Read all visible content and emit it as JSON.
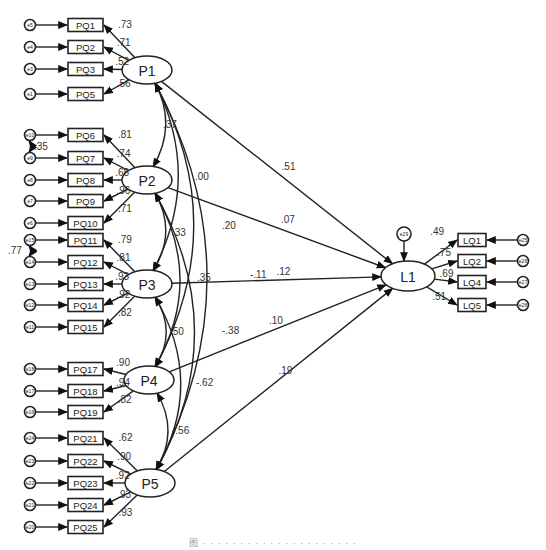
{
  "figure": {
    "caption": "图 · · · · · · · · · · · · · · · · · · · · ·"
  },
  "latents": [
    {
      "id": "P1",
      "label": "P1",
      "x": 147,
      "y": 70
    },
    {
      "id": "P2",
      "label": "P2",
      "x": 147,
      "y": 180
    },
    {
      "id": "P3",
      "label": "P3",
      "x": 147,
      "y": 284
    },
    {
      "id": "P4",
      "label": "P4",
      "x": 149,
      "y": 380
    },
    {
      "id": "P5",
      "label": "P5",
      "x": 150,
      "y": 483
    },
    {
      "id": "L1",
      "label": "L1",
      "x": 408,
      "y": 276
    }
  ],
  "indicators": [
    {
      "label": "PQ1",
      "error": "e5",
      "factor": "P1",
      "loading": ".73",
      "y": 25
    },
    {
      "label": "PQ2",
      "error": "e4",
      "factor": "P1",
      "loading": ".71",
      "y": 47
    },
    {
      "label": "PQ3",
      "error": "e3",
      "factor": "P1",
      "loading": ".52",
      "y": 69
    },
    {
      "label": "PQ5",
      "error": "e1",
      "factor": "P1",
      "loading": ".56",
      "y": 94
    },
    {
      "label": "PQ6",
      "error": "e10",
      "factor": "P2",
      "loading": ".81",
      "y": 135
    },
    {
      "label": "PQ7",
      "error": "e9",
      "factor": "P2",
      "loading": ".74",
      "y": 158
    },
    {
      "label": "PQ8",
      "error": "e8",
      "factor": "P2",
      "loading": ".68",
      "y": 180
    },
    {
      "label": "PQ9",
      "error": "e7",
      "factor": "P2",
      "loading": ".96",
      "y": 201
    },
    {
      "label": "PQ10",
      "error": "e6",
      "factor": "P2",
      "loading": ".71",
      "y": 223
    },
    {
      "label": "PQ11",
      "error": "e15",
      "factor": "P3",
      "loading": ".79",
      "y": 240
    },
    {
      "label": "PQ12",
      "error": "e14",
      "factor": "P3",
      "loading": ".81",
      "y": 262
    },
    {
      "label": "PQ13",
      "error": "e13",
      "factor": "P3",
      "loading": ".93",
      "y": 284
    },
    {
      "label": "PQ14",
      "error": "e12",
      "factor": "P3",
      "loading": ".92",
      "y": 305
    },
    {
      "label": "PQ15",
      "error": "e11",
      "factor": "P3",
      "loading": ".82",
      "y": 327
    },
    {
      "label": "PQ17",
      "error": "e18",
      "factor": "P4",
      "loading": ".90",
      "y": 369
    },
    {
      "label": "PQ18",
      "error": "e17",
      "factor": "P4",
      "loading": ".94",
      "y": 391
    },
    {
      "label": "PQ19",
      "error": "e16",
      "factor": "P4",
      "loading": ".82",
      "y": 412
    },
    {
      "label": "PQ21",
      "error": "e24",
      "factor": "P5",
      "loading": ".62",
      "y": 438
    },
    {
      "label": "PQ22",
      "error": "e23",
      "factor": "P5",
      "loading": ".90",
      "y": 461
    },
    {
      "label": "PQ23",
      "error": "e22",
      "factor": "P5",
      "loading": ".92",
      "y": 483
    },
    {
      "label": "PQ24",
      "error": "e21",
      "factor": "P5",
      "loading": ".93",
      "y": 505
    },
    {
      "label": "PQ25",
      "error": "e20",
      "factor": "P5",
      "loading": ".93",
      "y": 527
    }
  ],
  "outcome_indicators": [
    {
      "label": "LQ1",
      "error": "e25",
      "loading": ".49",
      "y": 240
    },
    {
      "label": "LQ2",
      "error": "e26",
      "loading": ".75",
      "y": 261
    },
    {
      "label": "LQ4",
      "error": "e27",
      "loading": ".69",
      "y": 282
    },
    {
      "label": "LQ5",
      "error": "e28",
      "loading": ".51",
      "y": 305
    }
  ],
  "outcome_error": {
    "label": "e29"
  },
  "paths": [
    {
      "from": "P1",
      "to": "L1",
      "coef": ".51"
    },
    {
      "from": "P2",
      "to": "L1",
      "coef": ".07"
    },
    {
      "from": "P3",
      "to": "L1",
      "coef": ".12"
    },
    {
      "from": "P4",
      "to": "L1",
      "coef": ".10"
    },
    {
      "from": "P5",
      "to": "L1",
      "coef": ".19"
    }
  ],
  "covariances": [
    {
      "a": "P1",
      "b": "P2",
      "value": ".37"
    },
    {
      "a": "P1",
      "b": "P3",
      "value": ".00"
    },
    {
      "a": "P1",
      "b": "P4",
      "value": ".20"
    },
    {
      "a": "P1",
      "b": "P5",
      "value": "-.11"
    },
    {
      "a": "P2",
      "b": "P3",
      "value": ".33"
    },
    {
      "a": "P2",
      "b": "P4",
      "value": ".35"
    },
    {
      "a": "P2",
      "b": "P5",
      "value": "-.38"
    },
    {
      "a": "P3",
      "b": "P4",
      "value": ".50"
    },
    {
      "a": "P3",
      "b": "P5",
      "value": "-.62"
    },
    {
      "a": "P4",
      "b": "P5",
      "value": "-.56"
    }
  ],
  "error_covariances": [
    {
      "a": "e10",
      "b": "e9",
      "value": ".35"
    },
    {
      "a": "e15",
      "b": "e14",
      "value": ".77"
    }
  ]
}
